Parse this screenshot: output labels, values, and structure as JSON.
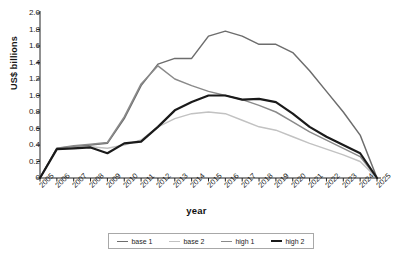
{
  "chart_data": {
    "type": "line",
    "title": "",
    "xlabel": "year",
    "ylabel": "US$ billions",
    "grid": false,
    "legend_position": "bottom",
    "ylim": [
      0,
      2.0
    ],
    "ytick_labels": [
      "2.0",
      "1.8",
      "1.6",
      "1.4",
      "1.2",
      "1.0",
      "0.8",
      "0.6",
      "0.4",
      "0.2",
      "0"
    ],
    "ytick_values": [
      2.0,
      1.8,
      1.6,
      1.4,
      1.2,
      1.0,
      0.8,
      0.6,
      0.4,
      0.2,
      0
    ],
    "categories": [
      "2005",
      "2006",
      "2007",
      "2008",
      "2009",
      "2010",
      "2011",
      "2012",
      "2013",
      "2014",
      "2015",
      "2016",
      "2017",
      "2018",
      "2019",
      "2020",
      "2021",
      "2022",
      "2023",
      "2024",
      "2025"
    ],
    "series": [
      {
        "name": "base 1",
        "color": "#6d6d6d",
        "width": 1.5,
        "values": [
          0.0,
          0.36,
          0.38,
          0.4,
          0.42,
          0.72,
          1.12,
          1.38,
          1.45,
          1.45,
          1.72,
          1.78,
          1.72,
          1.62,
          1.62,
          1.52,
          1.3,
          1.05,
          0.8,
          0.52,
          0.0
        ]
      },
      {
        "name": "base 2",
        "color": "#c2c2c2",
        "width": 1.5,
        "values": [
          0.0,
          0.35,
          0.37,
          0.38,
          0.36,
          0.4,
          0.46,
          0.62,
          0.72,
          0.78,
          0.8,
          0.78,
          0.7,
          0.62,
          0.58,
          0.5,
          0.42,
          0.35,
          0.28,
          0.2,
          0.0
        ]
      },
      {
        "name": "high 1",
        "color": "#8a8a8a",
        "width": 1.5,
        "values": [
          0.0,
          0.36,
          0.39,
          0.41,
          0.43,
          0.74,
          1.14,
          1.36,
          1.2,
          1.12,
          1.05,
          1.0,
          0.95,
          0.88,
          0.8,
          0.68,
          0.56,
          0.46,
          0.36,
          0.26,
          0.0
        ]
      },
      {
        "name": "high 2",
        "color": "#1a1a1a",
        "width": 2.2,
        "values": [
          0.0,
          0.35,
          0.36,
          0.37,
          0.3,
          0.42,
          0.44,
          0.62,
          0.82,
          0.92,
          1.0,
          1.0,
          0.95,
          0.96,
          0.92,
          0.78,
          0.62,
          0.5,
          0.4,
          0.3,
          0.0
        ]
      }
    ]
  },
  "legend": {
    "items": [
      {
        "label": "base 1"
      },
      {
        "label": "base 2"
      },
      {
        "label": "high 1"
      },
      {
        "label": "high 2"
      }
    ]
  }
}
